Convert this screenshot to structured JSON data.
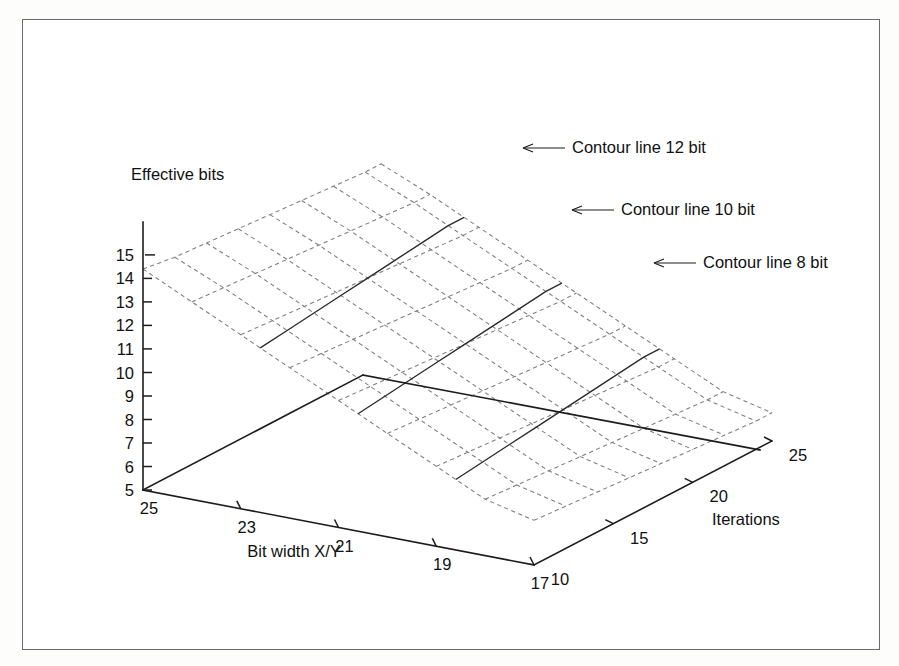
{
  "figure": {
    "border_color": "#6b6b6b",
    "background": "#ffffff"
  },
  "chart_data": {
    "type": "surface",
    "title": "",
    "subtitle": "",
    "zlabel": "Effective bits",
    "xlabel": "Bit width X/Y",
    "ylabel": "Iterations",
    "grid": true,
    "legend_position": "none",
    "projection": "3d-wireframe-mesh",
    "mesh_style": "dashed",
    "zticks": [
      15,
      14,
      13,
      12,
      11,
      10,
      9,
      8,
      7,
      6,
      5
    ],
    "ztick_labels": [
      "15",
      "14",
      "13",
      "12",
      "11",
      "10",
      "9",
      "8",
      "7",
      "6",
      "5"
    ],
    "zlim": [
      5,
      15
    ],
    "xticks": [
      25,
      23,
      21,
      19,
      17
    ],
    "xtick_labels": [
      "25",
      "23",
      "21",
      "19",
      "17"
    ],
    "xlim": [
      17,
      25
    ],
    "x_axis_direction": "descending-left-to-right",
    "yticks": [
      10,
      15,
      20,
      25
    ],
    "ytick_labels": [
      "10",
      "15",
      "20",
      "25"
    ],
    "ylim": [
      10,
      25
    ],
    "x_values": [
      25,
      24,
      23,
      22,
      21,
      20,
      19,
      18,
      17
    ],
    "y_values": [
      10,
      12,
      14,
      16,
      18,
      20,
      22,
      24,
      25
    ],
    "z_grid": [
      [
        14.4,
        14.2,
        14.1,
        14.0,
        13.9,
        13.8,
        13.7,
        13.6,
        13.6
      ],
      [
        13.4,
        13.3,
        13.2,
        13.1,
        13.0,
        12.9,
        12.8,
        12.7,
        12.7
      ],
      [
        12.4,
        12.3,
        12.2,
        12.1,
        12.0,
        11.9,
        11.8,
        11.7,
        11.7
      ],
      [
        11.4,
        11.3,
        11.2,
        11.1,
        11.0,
        10.9,
        10.8,
        10.7,
        10.7
      ],
      [
        10.4,
        10.3,
        10.2,
        10.1,
        10.0,
        9.9,
        9.8,
        9.7,
        9.7
      ],
      [
        9.4,
        9.3,
        9.2,
        9.1,
        9.0,
        8.9,
        8.8,
        8.7,
        8.7
      ],
      [
        8.4,
        8.3,
        8.2,
        8.1,
        8.0,
        7.9,
        7.8,
        7.7,
        7.7
      ],
      [
        7.4,
        7.3,
        7.2,
        7.1,
        7.0,
        6.9,
        6.8,
        6.7,
        6.7
      ],
      [
        6.9,
        6.8,
        6.7,
        6.6,
        6.5,
        6.4,
        6.3,
        6.2,
        6.2
      ]
    ],
    "contours": [
      {
        "level": 12,
        "label": "Contour line 12 bit",
        "unit": "bit"
      },
      {
        "level": 10,
        "label": "Contour line 10 bit",
        "unit": "bit"
      },
      {
        "level": 8,
        "label": "Contour line 8 bit",
        "unit": "bit"
      }
    ]
  },
  "annotations": [
    {
      "id": "contour-12",
      "text": "Contour line 12 bit"
    },
    {
      "id": "contour-10",
      "text": "Contour line 10 bit"
    },
    {
      "id": "contour-8",
      "text": "Contour line 8 bit"
    }
  ],
  "axes": {
    "z_title": "Effective bits",
    "x_title": "Bit width X/Y",
    "y_title": "Iterations"
  }
}
